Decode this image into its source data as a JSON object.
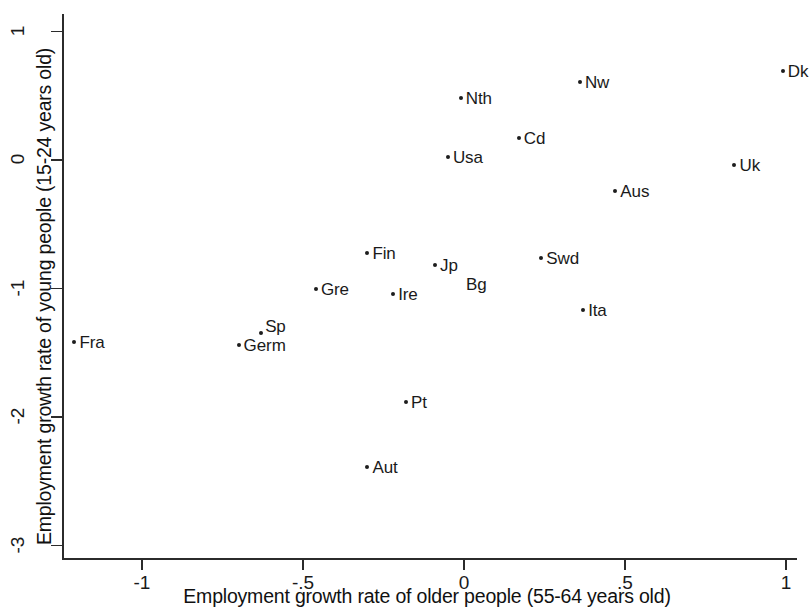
{
  "chart_data": {
    "type": "scatter",
    "title": "",
    "xlabel": "Employment growth rate of older people (55-64 years old)",
    "ylabel": "Employment growth rate of young people (15-24 years old)",
    "xlim": [
      -1.25,
      1.06
    ],
    "ylim": [
      -3.13,
      1.12
    ],
    "xticks": [
      -1,
      -0.5,
      0,
      0.5,
      1
    ],
    "xtick_labels": [
      "-1",
      "-.5",
      "0",
      ".5",
      "1"
    ],
    "yticks": [
      1,
      0,
      -1,
      -2,
      -3
    ],
    "ytick_labels": [
      "1",
      "0",
      "-1",
      "-2",
      "-3"
    ],
    "grid": false,
    "legend": "none",
    "marker_color": "#1d1d1d",
    "points": [
      {
        "label": "Fra",
        "x": -1.21,
        "y": -1.42
      },
      {
        "label": "Germ",
        "x": -0.7,
        "y": -1.44
      },
      {
        "label": "Sp",
        "x": -0.63,
        "y": -1.35
      },
      {
        "label": "Gre",
        "x": -0.46,
        "y": -1.0
      },
      {
        "label": "Fin",
        "x": -0.3,
        "y": -0.72
      },
      {
        "label": "Aut",
        "x": -0.3,
        "y": -2.39
      },
      {
        "label": "Ire",
        "x": -0.22,
        "y": -1.04
      },
      {
        "label": "Pt",
        "x": -0.18,
        "y": -1.88
      },
      {
        "label": "Jp",
        "x": -0.09,
        "y": -0.82
      },
      {
        "label": "Bg",
        "x": 0.0,
        "y": -0.88
      },
      {
        "label": "Usa",
        "x": -0.05,
        "y": 0.02
      },
      {
        "label": "Nth",
        "x": -0.01,
        "y": 0.48
      },
      {
        "label": "Cd",
        "x": 0.17,
        "y": 0.17
      },
      {
        "label": "Swd",
        "x": 0.24,
        "y": -0.76
      },
      {
        "label": "Nw",
        "x": 0.36,
        "y": 0.61
      },
      {
        "label": "Ita",
        "x": 0.37,
        "y": -1.17
      },
      {
        "label": "Aus",
        "x": 0.47,
        "y": -0.24
      },
      {
        "label": "Uk",
        "x": 0.84,
        "y": -0.04
      },
      {
        "label": "Dk",
        "x": 0.99,
        "y": 0.69
      }
    ]
  },
  "axes": {
    "x_title": "Employment growth rate of older people (55-64 years old)",
    "y_title": "Employment growth rate of young people (15-24 years old)",
    "x_ticks": [
      "-1",
      "-.5",
      "0",
      ".5",
      "1"
    ],
    "y_ticks": [
      "1",
      "0",
      "-1",
      "-2",
      "-3"
    ]
  }
}
